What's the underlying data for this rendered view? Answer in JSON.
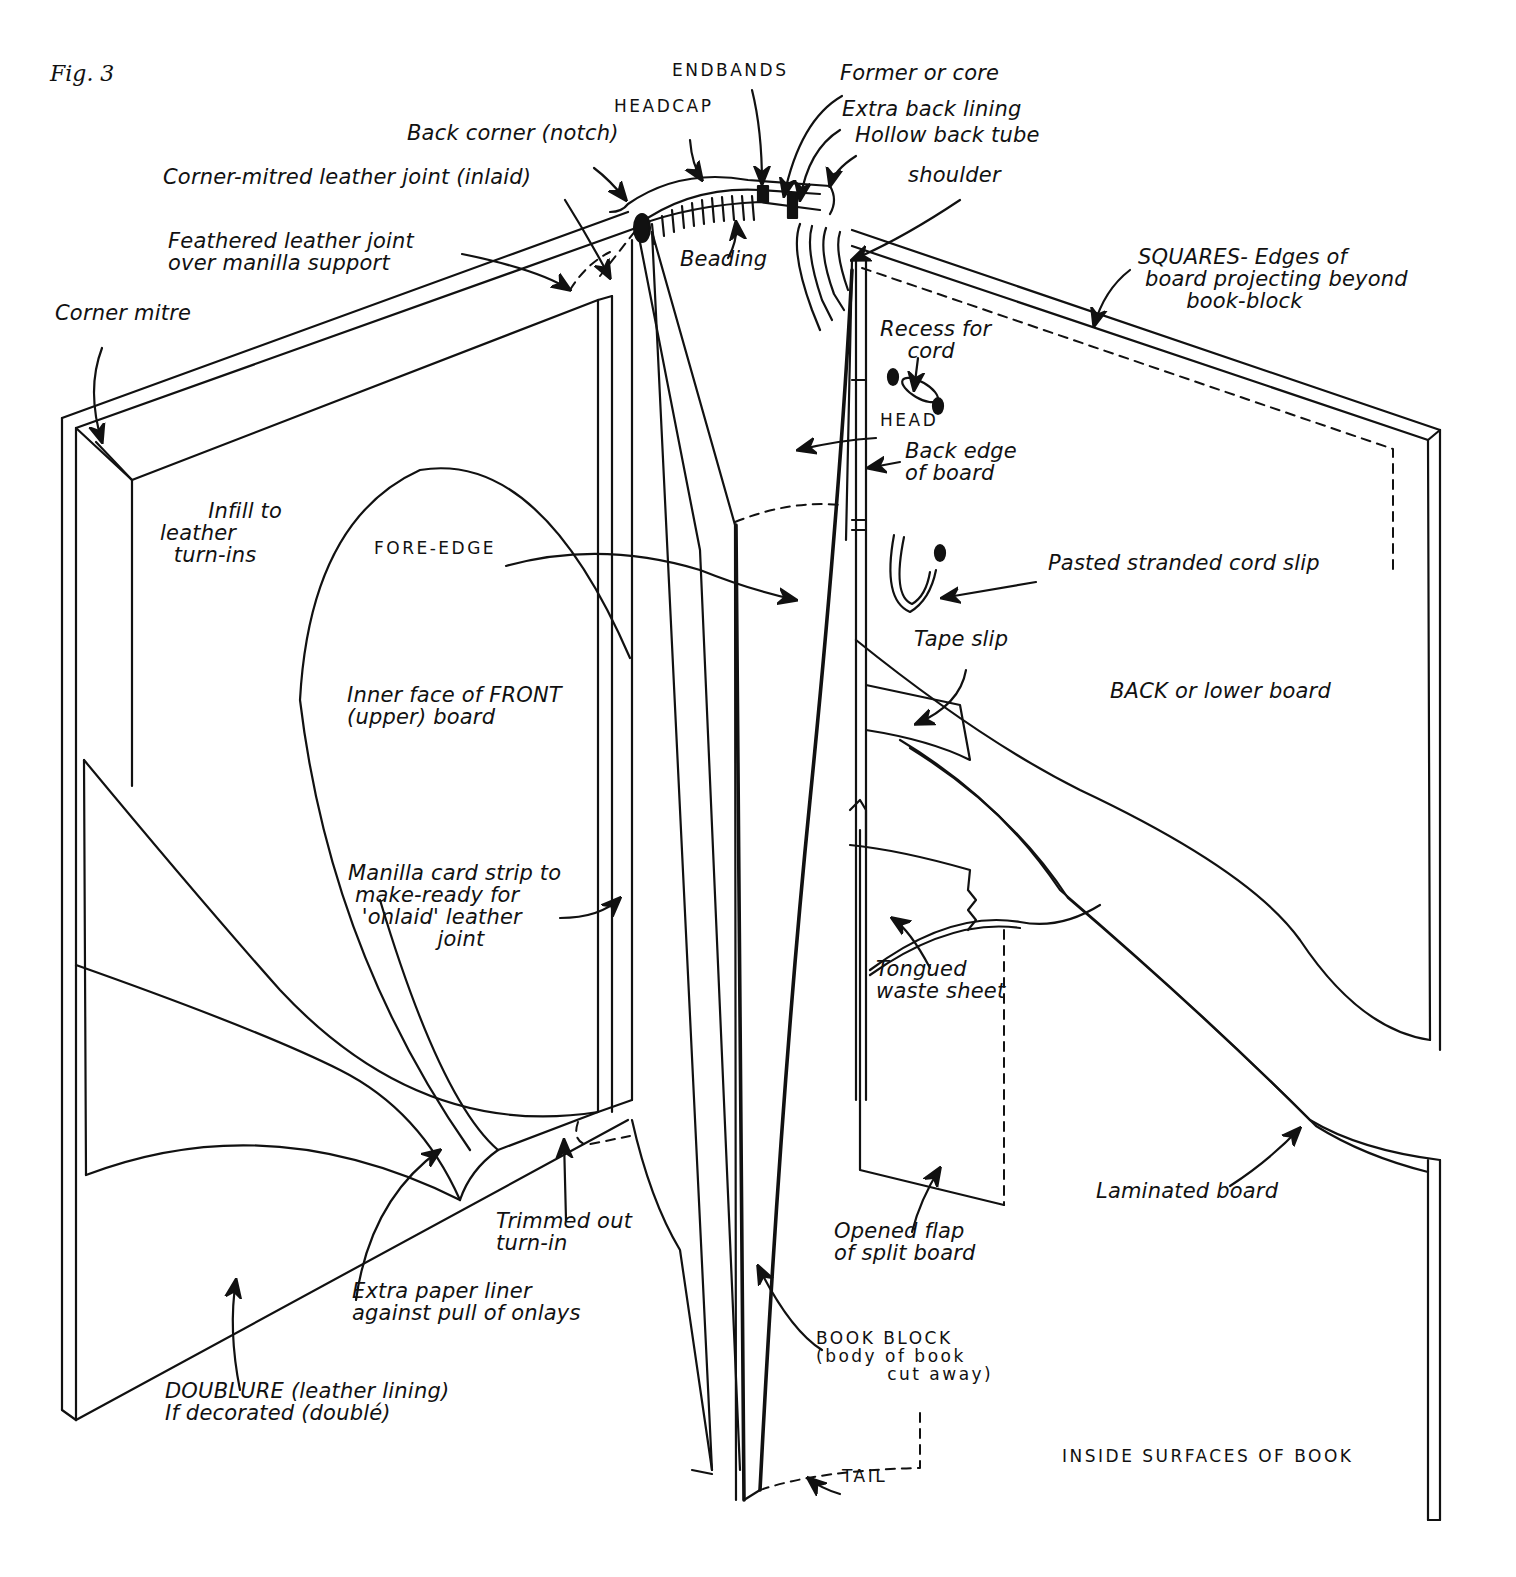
{
  "figure": {
    "number": "Fig. 3",
    "caption": "INSIDE SURFACES OF BOOK",
    "ink_color": "#111111",
    "paper_color": "#ffffff"
  },
  "labels": {
    "endbands": "ENDBANDS",
    "former_or_core": "Former or core",
    "headcap": "HEADCAP",
    "extra_back_lining": "Extra back lining",
    "hollow_back_tube": "Hollow back tube",
    "back_corner_notch": "Back corner (notch)",
    "shoulder": "shoulder",
    "corner_mitred_leather_joint": "Corner-mitred leather joint (inlaid)",
    "feathered_leather_joint": "Feathered leather joint\nover manilla support",
    "beading": "Beading",
    "squares": "SQUARES- Edges of\n board projecting beyond\n       book-block",
    "corner_mitre": "Corner mitre",
    "recess_for_cord": "Recess for\n    cord",
    "head": "HEAD",
    "back_edge_of_board": "Back edge\nof board",
    "infill_to_leather_turn_ins": "       Infill to\nleather\n  turn-ins",
    "fore_edge": "FORE-EDGE",
    "pasted_stranded_cord_slip": "Pasted stranded cord slip",
    "tape_slip": "Tape slip",
    "inner_face_front_board": "Inner face of FRONT\n(upper) board",
    "back_or_lower_board": "BACK or lower board",
    "manilla_card_strip": "Manilla card strip to\n make-ready for\n  'onlaid' leather\n             joint",
    "tongued_waste_sheet": "Tongued\nwaste sheet",
    "laminated_board": "Laminated board",
    "trimmed_out_turn_in": "Trimmed out\nturn-in",
    "opened_flap_split_board": "Opened flap\nof split board",
    "extra_paper_liner": "Extra paper liner\nagainst pull of onlays",
    "book_block": "BOOK BLOCK\n(body of book\n         cut away)",
    "doublure": "DOUBLURE (leather lining)\nIf decorated (doublé)",
    "tail": "TAIL"
  },
  "label_positions": {
    "fig": [
      50,
      78
    ],
    "endbands": [
      672,
      78
    ],
    "former_or_core": [
      840,
      78
    ],
    "headcap": [
      614,
      114
    ],
    "extra_back_lining": [
      842,
      114
    ],
    "hollow_back_tube": [
      855,
      140
    ],
    "back_corner_notch": [
      407,
      138
    ],
    "shoulder": [
      908,
      180
    ],
    "corner_mitred_leather_joint": [
      163,
      182
    ],
    "feathered_leather_joint": [
      168,
      246
    ],
    "beading": [
      680,
      264
    ],
    "squares": [
      1138,
      262
    ],
    "corner_mitre": [
      55,
      318
    ],
    "recess_for_cord": [
      880,
      334
    ],
    "head": [
      880,
      428
    ],
    "back_edge_of_board": [
      905,
      456
    ],
    "infill_to_leather_turn_ins": [
      160,
      516
    ],
    "fore_edge": [
      374,
      556
    ],
    "pasted_stranded_cord_slip": [
      1048,
      568
    ],
    "tape_slip": [
      914,
      644
    ],
    "inner_face_front_board": [
      347,
      700
    ],
    "back_or_lower_board": [
      1110,
      696
    ],
    "manilla_card_strip": [
      348,
      878
    ],
    "tongued_waste_sheet": [
      876,
      974
    ],
    "laminated_board": [
      1096,
      1196
    ],
    "trimmed_out_turn_in": [
      496,
      1226
    ],
    "opened_flap_split_board": [
      834,
      1236
    ],
    "extra_paper_liner": [
      352,
      1296
    ],
    "book_block": [
      816,
      1346
    ],
    "doublure": [
      165,
      1396
    ],
    "caption": [
      1062,
      1464
    ],
    "tail": [
      842,
      1484
    ]
  }
}
